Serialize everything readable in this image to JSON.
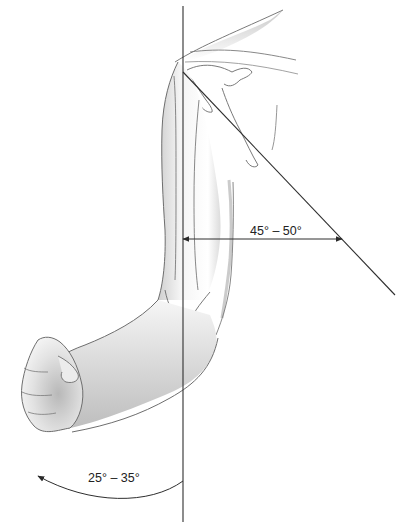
{
  "figure": {
    "measurements": [
      {
        "id": "abduction",
        "label": "45° – 50°",
        "kind": "angle between vertical axis and arm line"
      },
      {
        "id": "rotation",
        "label": "25° – 35°",
        "kind": "arc of rotation"
      }
    ],
    "colors": {
      "line": "#3a3a3a",
      "skin_shade": "#bdbdbd",
      "outline": "#6e6e6e",
      "background": "#ffffff"
    }
  }
}
